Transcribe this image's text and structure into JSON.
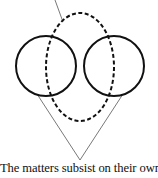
{
  "caption": "The matters subsist on their own.",
  "colors": {
    "stroke": "#111111",
    "background": "#ffffff",
    "thin_line": "#555555"
  },
  "shapes": {
    "left_circle": {
      "cx": 46,
      "cy": 66,
      "r": 30,
      "style": "solid"
    },
    "right_circle": {
      "cx": 114,
      "cy": 66,
      "r": 30,
      "style": "solid"
    },
    "dashed_ellipse": {
      "cx": 80,
      "cy": 67,
      "rx": 34,
      "ry": 54,
      "style": "dashed"
    },
    "pointer_line": {
      "x1": 55,
      "y1": 0,
      "x2": 63,
      "y2": 22
    },
    "v_lines": [
      {
        "x1": 37,
        "y1": 94,
        "x2": 80,
        "y2": 160
      },
      {
        "x1": 123,
        "y1": 94,
        "x2": 80,
        "y2": 160
      }
    ]
  }
}
